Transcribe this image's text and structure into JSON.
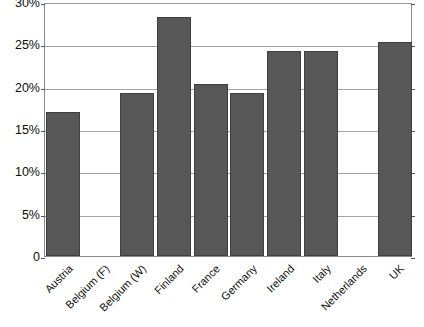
{
  "chart_data": {
    "type": "bar",
    "title": "",
    "subtitle": "",
    "xlabel": "",
    "ylabel": "",
    "categories": [
      "Austria",
      "Belgium (F)",
      "Belgium (W)",
      "Finland",
      "France",
      "Germany",
      "Ireland",
      "Italy",
      "Netherlands",
      "UK"
    ],
    "values": [
      17.0,
      null,
      19.2,
      28.2,
      20.3,
      19.2,
      24.2,
      24.2,
      null,
      25.3
    ],
    "value_unit": "%",
    "ylim": [
      0,
      30
    ],
    "ytick_values": [
      0,
      5,
      10,
      15,
      20,
      25,
      30
    ],
    "ytick_labels": [
      "0",
      "5%",
      "10%",
      "15%",
      "20%",
      "25%",
      "30%"
    ],
    "grid": true,
    "grid_axis": "y",
    "legend": false,
    "legend_position": "none",
    "bar_color": "#575757",
    "bar_edge_color": "#3f3f3f",
    "plot_background": "#ffffff",
    "axis_color": "#8a8a8a",
    "gridline_color": "#a2a2a2",
    "xtick_label_rotation": -45,
    "missing_categories": [
      "Belgium (F)",
      "Netherlands"
    ]
  }
}
